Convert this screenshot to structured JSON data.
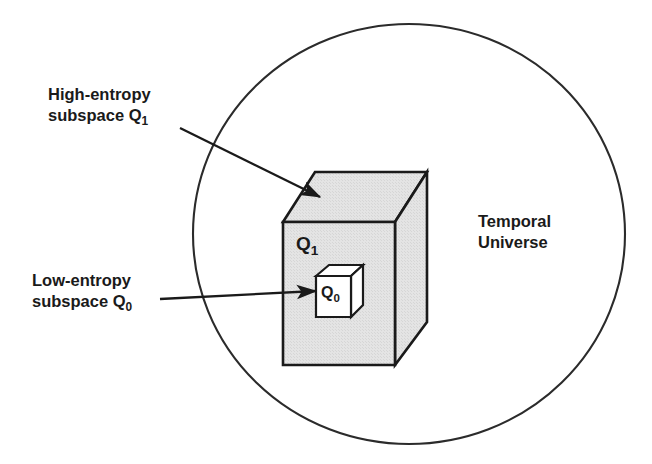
{
  "figure": {
    "background_color": "#ffffff",
    "line_color": "#1a1a1a",
    "box_fill_color": "#e3e3e3",
    "inner_box_fill_color": "#ffffff"
  },
  "labels": {
    "high_entropy": {
      "line1": "High-entropy",
      "line2_prefix": "subspace Q",
      "line2_sub": "1"
    },
    "low_entropy": {
      "line1": "Low-entropy",
      "line2_prefix": "subspace Q",
      "line2_sub": "0"
    },
    "temporal_universe": {
      "line1": "Temporal",
      "line2": "Universe"
    },
    "q1": {
      "text": "Q",
      "sub": "1"
    },
    "q0": {
      "text": "Q",
      "sub": "0"
    }
  },
  "shapes": {
    "universe_ellipse": {
      "name": "Temporal Universe",
      "cx": 409,
      "cy": 234,
      "rx": 216,
      "ry": 210
    },
    "outer_box": {
      "name": "High-entropy subspace Q1",
      "front_top_left": [
        283,
        222
      ],
      "front_top_right": [
        395,
        222
      ],
      "front_bottom_right": [
        395,
        365
      ],
      "front_bottom_left": [
        283,
        365
      ],
      "back_top_left": [
        315,
        172
      ],
      "back_top_right": [
        427,
        172
      ],
      "back_bottom_right": [
        427,
        322
      ]
    },
    "inner_box": {
      "name": "Low-entropy subspace Q0",
      "front_top_left": [
        316,
        276
      ],
      "front_top_right": [
        351,
        276
      ],
      "front_bottom_right": [
        351,
        317
      ],
      "front_bottom_left": [
        316,
        317
      ],
      "back_top_left": [
        329,
        265
      ],
      "back_top_right": [
        363,
        265
      ],
      "back_bottom_right": [
        363,
        305
      ]
    }
  },
  "arrows": [
    {
      "name": "arrow-high-entropy",
      "from": [
        180,
        128
      ],
      "to": [
        320,
        197
      ]
    },
    {
      "name": "arrow-low-entropy",
      "from": [
        160,
        299
      ],
      "to": [
        316,
        291
      ]
    }
  ]
}
